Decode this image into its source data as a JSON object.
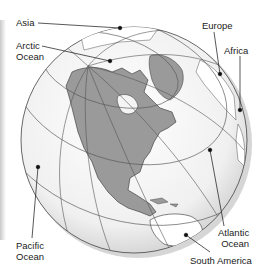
{
  "map": {
    "type": "orthographic globe",
    "colors": {
      "land_focus": "#9a9a9a",
      "land_other": "#ffffff",
      "ocean": "#f2f2f2",
      "grid": "#555555",
      "outline": "#444444"
    }
  },
  "labels": {
    "asia": "Asia",
    "arctic_line1": "Arctic",
    "arctic_line2": "Ocean",
    "europe": "Europe",
    "africa": "Africa",
    "pacific_line1": "Pacific",
    "pacific_line2": "Ocean",
    "atlantic_line1": "Atlantic",
    "atlantic_line2": "Ocean",
    "south_america": "South America"
  }
}
